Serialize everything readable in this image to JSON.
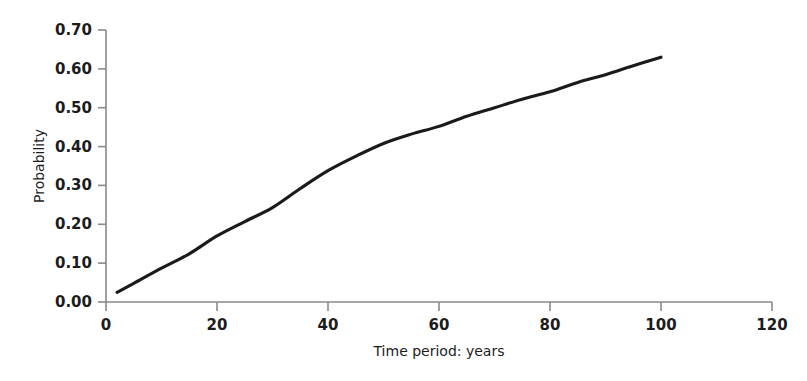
{
  "chart_data": {
    "type": "line",
    "title": "",
    "subtitle": "",
    "xlabel": "Time period: years",
    "ylabel": "Probability",
    "xlim": [
      0,
      120
    ],
    "ylim": [
      0.0,
      0.7
    ],
    "grid": false,
    "legend": null,
    "legend_position": "none",
    "x_ticks": [
      0,
      20,
      40,
      60,
      80,
      100,
      120
    ],
    "x_tick_labels": [
      "0",
      "20",
      "40",
      "60",
      "80",
      "100",
      "120"
    ],
    "y_ticks": [
      0.0,
      0.1,
      0.2,
      0.3,
      0.4,
      0.5,
      0.6,
      0.7
    ],
    "y_tick_labels": [
      "0.00",
      "0.10",
      "0.20",
      "0.30",
      "0.40",
      "0.50",
      "0.60",
      "0.70"
    ],
    "series": [
      {
        "name": "Probability",
        "color": "#1a1a1a",
        "x": [
          2,
          5,
          10,
          15,
          20,
          25,
          30,
          35,
          40,
          45,
          50,
          55,
          60,
          65,
          70,
          75,
          80,
          85,
          90,
          95,
          100
        ],
        "values": [
          0.025,
          0.048,
          0.087,
          0.124,
          0.17,
          0.207,
          0.243,
          0.292,
          0.338,
          0.375,
          0.408,
          0.432,
          0.452,
          0.478,
          0.5,
          0.522,
          0.541,
          0.565,
          0.585,
          0.608,
          0.63
        ]
      }
    ],
    "annotations": []
  },
  "axes": {
    "y_axis_title": "Probability",
    "x_axis_title": "Time period: years",
    "axis_color": "#8a8a8a",
    "text_color": "#1c1c1c"
  },
  "figure": {
    "background_color": "#ffffff",
    "curve_color": "#1a1a1a"
  }
}
